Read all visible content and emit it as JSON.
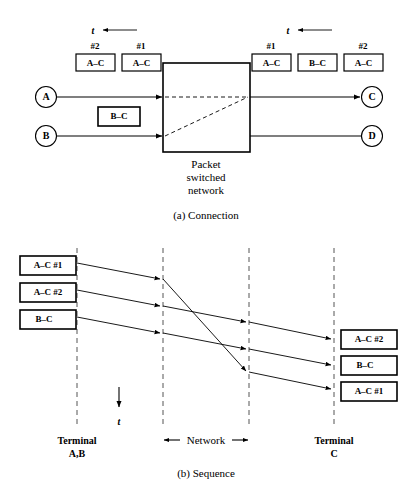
{
  "figure": {
    "panel_a": {
      "caption": "(a) Connection",
      "time_axis_label": "t",
      "network_box": {
        "line1": "Packet",
        "line2": "switched",
        "line3": "network"
      },
      "source_nodes": [
        {
          "label": "A"
        },
        {
          "label": "B"
        }
      ],
      "dest_nodes": [
        {
          "label": "C"
        },
        {
          "label": "D"
        }
      ],
      "left_packets": [
        {
          "seq": "#2",
          "label": "A–C"
        },
        {
          "seq": "#1",
          "label": "A–C"
        }
      ],
      "left_queued_packet": {
        "label": "B–C"
      },
      "right_packets": [
        {
          "seq": "#1",
          "label": "A–C"
        },
        {
          "seq": "",
          "label": "B–C"
        },
        {
          "seq": "#2",
          "label": "A–C"
        }
      ]
    },
    "panel_b": {
      "caption": "(b) Sequence",
      "time_axis_label": "t",
      "network_span_label": "Network",
      "left_terminal": {
        "line1": "Terminal",
        "line2": "A,B"
      },
      "right_terminal": {
        "line1": "Terminal",
        "line2": "C"
      },
      "send_packets": [
        {
          "label": "A–C #1"
        },
        {
          "label": "A–C #2"
        },
        {
          "label": "B–C"
        }
      ],
      "receive_packets": [
        {
          "label": "A–C #2"
        },
        {
          "label": "B–C"
        },
        {
          "label": "A–C #1"
        }
      ]
    }
  },
  "colors": {
    "ink": "#000000",
    "paper": "#ffffff",
    "guide": "#555555"
  }
}
